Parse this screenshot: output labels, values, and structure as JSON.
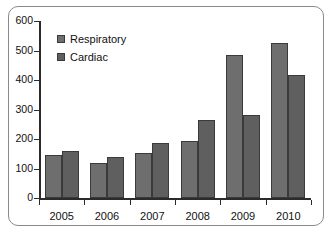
{
  "chart_data": {
    "type": "bar",
    "title": "",
    "subtitle": "",
    "xlabel": "",
    "ylabel": "",
    "categories": [
      "2005",
      "2006",
      "2007",
      "2008",
      "2009",
      "2010"
    ],
    "series": [
      {
        "name": "Respiratory",
        "color": "#6e6e6e",
        "values": [
          147,
          118,
          151,
          194,
          484,
          525
        ]
      },
      {
        "name": "Cardiac",
        "color": "#5f5f5f",
        "values": [
          158,
          140,
          188,
          263,
          281,
          418
        ]
      }
    ],
    "ylim": [
      0,
      600
    ],
    "yticks": [
      0,
      100,
      200,
      300,
      400,
      500,
      600
    ],
    "ytick_labels": [
      "0",
      "100",
      "200",
      "300",
      "400",
      "500",
      "600"
    ],
    "grid": false,
    "legend_position": "top-left",
    "legend_entries": [
      "Respiratory",
      "Cardiac"
    ]
  },
  "frame": {
    "border_color": "#8a8a8a"
  }
}
